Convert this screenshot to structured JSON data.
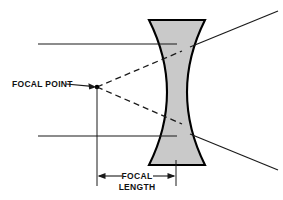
{
  "figure": {
    "type": "optics-diagram",
    "background_color": "#ffffff",
    "line_color": "#1a1a1a",
    "lens_fill_color": "#c9c9c9",
    "lens_outline_color": "#000000"
  },
  "labels": {
    "focal_point": "FOCAL POINT",
    "focal_length_line1": "FOCAL",
    "focal_length_line2": "LENGTH"
  },
  "icons": {
    "leader_arrow": "arrow-right-icon",
    "dimension_arrow_left": "arrow-left-icon",
    "dimension_arrow_right": "arrow-right-icon"
  },
  "geometry": {
    "focal_point": {
      "x": 97,
      "y": 87
    },
    "lens": {
      "top_y": 20,
      "bottom_y": 165,
      "top_left_x": 149,
      "top_right_x": 205,
      "waist_left_x": 167,
      "waist_right_x": 187,
      "waist_y": 92
    },
    "incident_ray_upper": {
      "x1": 38,
      "y1": 44,
      "x2": 177,
      "y2": 44
    },
    "incident_ray_lower": {
      "x1": 38,
      "y1": 136,
      "x2": 177,
      "y2": 136
    },
    "exit_ray_upper": {
      "x1": 192,
      "y1": 47,
      "x2": 278,
      "y2": 11
    },
    "exit_ray_lower": {
      "x1": 192,
      "y1": 134,
      "x2": 278,
      "y2": 170
    },
    "dashed_ray_upper": {
      "x1": 97,
      "y1": 87,
      "x2": 180,
      "y2": 52
    },
    "dashed_ray_lower": {
      "x1": 97,
      "y1": 87,
      "x2": 180,
      "y2": 124
    },
    "dimension_line": {
      "y": 176,
      "x_start": 97,
      "x_end": 176
    },
    "extension_line_left": {
      "x": 97,
      "y1": 87,
      "y2": 186
    },
    "extension_line_right": {
      "x": 176,
      "y1": 160,
      "y2": 186
    },
    "leader_line": {
      "x1": 68,
      "y1": 84,
      "x2": 95,
      "y2": 87
    }
  }
}
